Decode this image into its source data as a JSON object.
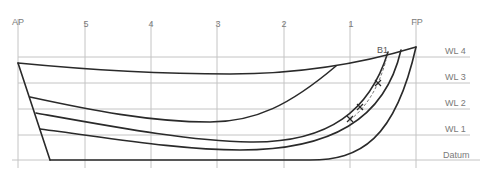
{
  "diagram": {
    "type": "lines-plan-profile",
    "stations": [
      {
        "label": "AP",
        "x": 18
      },
      {
        "label": "5",
        "x": 85
      },
      {
        "label": "4",
        "x": 151
      },
      {
        "label": "3",
        "x": 217
      },
      {
        "label": "2",
        "x": 284
      },
      {
        "label": "1",
        "x": 350
      },
      {
        "label": "FP",
        "x": 416
      }
    ],
    "waterlines": [
      {
        "label": "WL 4",
        "y": 57
      },
      {
        "label": "WL 3",
        "y": 83
      },
      {
        "label": "WL 2",
        "y": 109
      },
      {
        "label": "WL 1",
        "y": 135
      },
      {
        "label": "Datum",
        "y": 160
      }
    ],
    "buttock_label": "B1",
    "colors": {
      "grid": "#c4c4c4",
      "hull": "#2a2a2a",
      "label": "#7a7a7a"
    }
  }
}
